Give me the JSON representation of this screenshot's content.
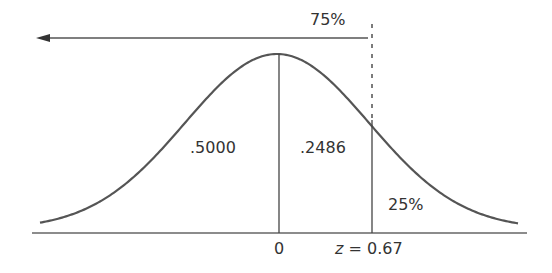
{
  "diagram": {
    "type": "normal-distribution-curve",
    "colors": {
      "curve": "#555555",
      "lines": "#444444",
      "text": "#333333",
      "background": "#ffffff"
    },
    "labels": {
      "top_percent": "75%",
      "left_area": ".5000",
      "middle_area": ".2486",
      "tail_percent": "25%",
      "axis_zero": "0",
      "z_var": "z",
      "z_eq": " = 0.67"
    },
    "z_value": 0.67,
    "areas": {
      "left_of_mean": 0.5,
      "mean_to_z": 0.2486,
      "right_tail_percent": 25,
      "left_of_z_percent": 75
    }
  }
}
